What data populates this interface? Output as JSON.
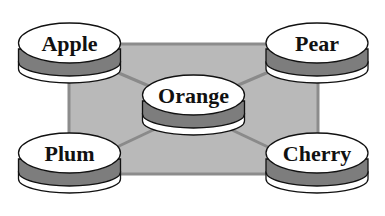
{
  "diagram": {
    "type": "star-network",
    "colors": {
      "background": "#ffffff",
      "panel_fill": "#b9b9b9",
      "panel_border": "#8c8c8c",
      "connector": "#8a8a8a",
      "disk_top": "#ffffff",
      "disk_band": "#7d7d7d",
      "disk_base": "#ffffff",
      "outline": "#111111",
      "label": "#111111"
    },
    "center_node": {
      "label": "Orange"
    },
    "nodes": [
      {
        "label": "Apple",
        "position": "top-left"
      },
      {
        "label": "Pear",
        "position": "top-right"
      },
      {
        "label": "Plum",
        "position": "bottom-left"
      },
      {
        "label": "Cherry",
        "position": "bottom-right"
      }
    ],
    "edges": [
      {
        "from": "Apple",
        "to": "Orange"
      },
      {
        "from": "Pear",
        "to": "Orange"
      },
      {
        "from": "Plum",
        "to": "Orange"
      },
      {
        "from": "Cherry",
        "to": "Orange"
      }
    ]
  }
}
